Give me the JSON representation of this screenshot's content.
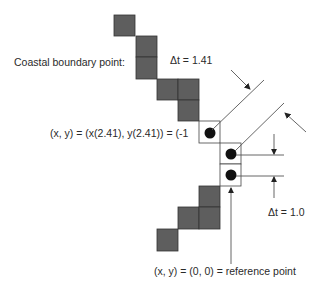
{
  "diagram": {
    "labels": {
      "coastal_boundary": "Coastal boundary point:",
      "boundary_coord": "(x, y) = (x(2.41), y(2.41)) = (-1",
      "delta_t_diag": "Δt = 1.41",
      "delta_t_vert": "Δt = 1.0",
      "reference": "(x, y) = (0, 0) = reference point"
    },
    "colors": {
      "land_cell": "#5e5e5e",
      "open_cell": "#ffffff",
      "marker": "#111111",
      "line": "#555555"
    }
  }
}
